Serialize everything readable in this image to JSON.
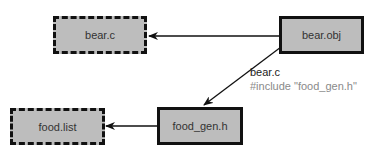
{
  "colors": {
    "node_fill": "#bdbdbd",
    "border": "#111111",
    "edge": "#111111",
    "sub_label": "#8a8a8a"
  },
  "nodes": [
    {
      "id": "bear_c",
      "label": "bear.c",
      "style": "dashed"
    },
    {
      "id": "bear_obj",
      "label": "bear.obj",
      "style": "solid"
    },
    {
      "id": "food_list",
      "label": "food.list",
      "style": "dashed"
    },
    {
      "id": "food_gen_h",
      "label": "food_gen.h",
      "style": "solid"
    }
  ],
  "edges": [
    {
      "from": "bear.obj",
      "to": "bear.c"
    },
    {
      "from": "bear.obj",
      "to": "food_gen.h",
      "label": "bear.c",
      "sublabel": "#include \"food_gen.h\""
    },
    {
      "from": "food_gen.h",
      "to": "food.list"
    }
  ]
}
